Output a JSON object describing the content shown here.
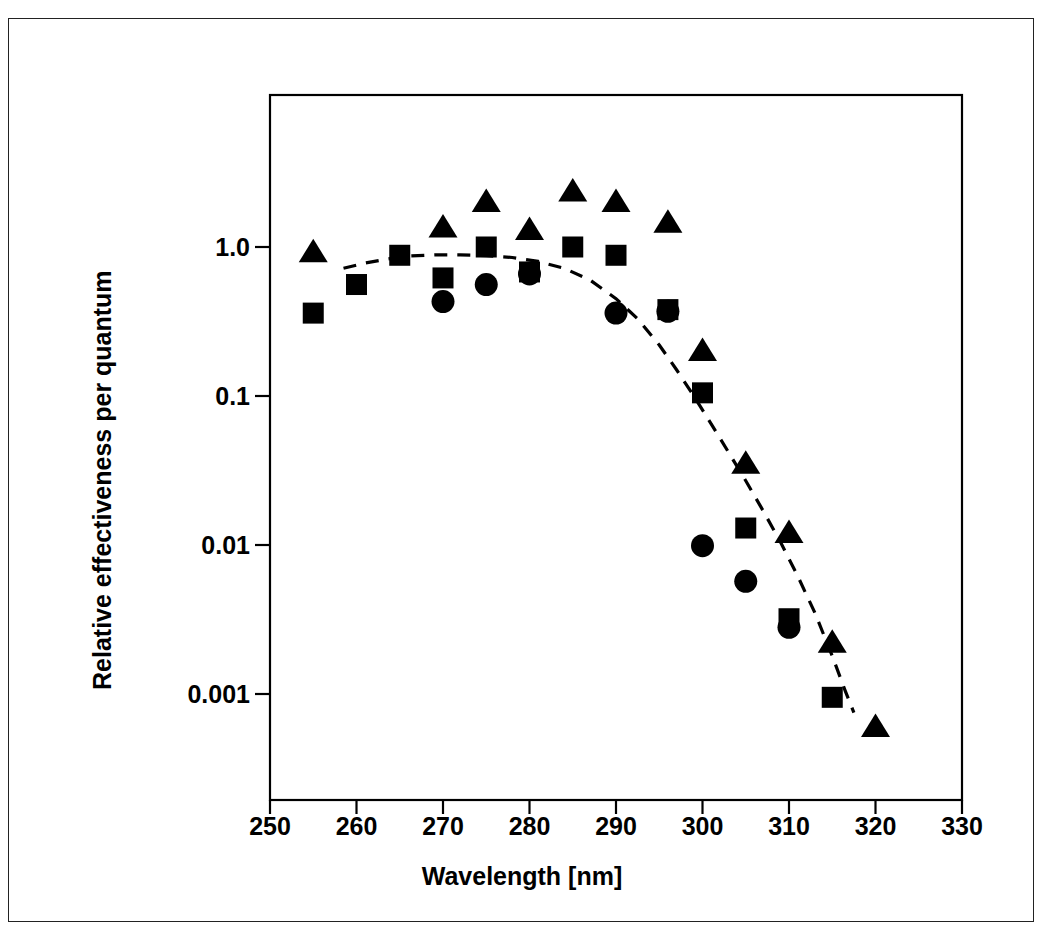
{
  "figure": {
    "background_color": "#ffffff",
    "ink_color": "#000000"
  },
  "axes": {
    "x_title": "Wavelength [nm]",
    "y_title": "Relative effectiveness per quantum",
    "x_ticks": [
      "250",
      "260",
      "270",
      "280",
      "290",
      "300",
      "310",
      "320",
      "330"
    ],
    "y_ticks": [
      "1.0",
      "0.1",
      "0.01",
      "0.001"
    ]
  },
  "chart_data": {
    "type": "scatter",
    "title": "",
    "xlabel": "Wavelength [nm]",
    "ylabel": "Relative effectiveness per quantum",
    "xlim": [
      250,
      330
    ],
    "ylim": [
      0.0003,
      4.0
    ],
    "yscale": "log",
    "xscale": "linear",
    "x_tick_values": [
      250,
      260,
      270,
      280,
      290,
      300,
      310,
      320,
      330
    ],
    "y_tick_values": [
      1.0,
      0.1,
      0.01,
      0.001
    ],
    "grid": false,
    "legend": "none",
    "series": [
      {
        "name": "triangles",
        "marker": "triangle",
        "color": "#000000",
        "points": [
          [
            255,
            0.92
          ],
          [
            270,
            1.35
          ],
          [
            275,
            2.0
          ],
          [
            280,
            1.3
          ],
          [
            285,
            2.35
          ],
          [
            290,
            2.0
          ],
          [
            296,
            1.45
          ],
          [
            300,
            0.2
          ],
          [
            305,
            0.035
          ],
          [
            310,
            0.012
          ],
          [
            315,
            0.0022
          ],
          [
            320,
            0.0006
          ]
        ]
      },
      {
        "name": "squares",
        "marker": "square",
        "color": "#000000",
        "points": [
          [
            255,
            0.36
          ],
          [
            260,
            0.56
          ],
          [
            265,
            0.88
          ],
          [
            270,
            0.62
          ],
          [
            275,
            1.0
          ],
          [
            280,
            0.68
          ],
          [
            285,
            1.0
          ],
          [
            290,
            0.88
          ],
          [
            296,
            0.38
          ],
          [
            300,
            0.105
          ],
          [
            305,
            0.013
          ],
          [
            310,
            0.0032
          ],
          [
            315,
            0.00095
          ]
        ]
      },
      {
        "name": "circles",
        "marker": "circle",
        "color": "#000000",
        "points": [
          [
            270,
            0.43
          ],
          [
            275,
            0.56
          ],
          [
            280,
            0.66
          ],
          [
            290,
            0.36
          ],
          [
            296,
            0.37
          ],
          [
            300,
            0.0099
          ],
          [
            305,
            0.0057
          ],
          [
            310,
            0.0028
          ]
        ]
      }
    ],
    "curves": [
      {
        "name": "action-spectrum-dashed-curve",
        "style": "dashed",
        "color": "#000000",
        "points": [
          [
            258.5,
            0.72
          ],
          [
            261,
            0.78
          ],
          [
            263.5,
            0.83
          ],
          [
            266,
            0.87
          ],
          [
            269,
            0.885
          ],
          [
            272,
            0.885
          ],
          [
            275,
            0.875
          ],
          [
            278,
            0.85
          ],
          [
            281,
            0.8
          ],
          [
            284,
            0.72
          ],
          [
            287,
            0.6
          ],
          [
            290,
            0.45
          ],
          [
            292.5,
            0.33
          ],
          [
            295,
            0.22
          ],
          [
            297,
            0.15
          ],
          [
            299,
            0.1
          ],
          [
            301,
            0.065
          ],
          [
            303,
            0.042
          ],
          [
            305,
            0.027
          ],
          [
            307,
            0.017
          ],
          [
            309,
            0.0105
          ],
          [
            311,
            0.0062
          ],
          [
            313,
            0.0035
          ],
          [
            315,
            0.0018
          ],
          [
            316.5,
            0.00105
          ],
          [
            317.5,
            0.00075
          ]
        ]
      }
    ]
  }
}
